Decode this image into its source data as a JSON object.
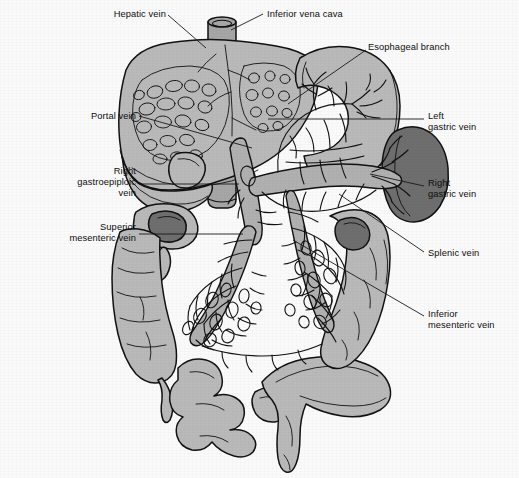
{
  "figure": {
    "background_color": "#fafafa",
    "ink_color": "#111111",
    "width": 519,
    "height": 478
  },
  "palette": {
    "organ_light_gray": "#b9b9b9",
    "organ_mid_gray": "#a6a6a6",
    "spleen_dark_gray": "#6e6e6e",
    "vessel_gray": "#b0b0b0",
    "lumen_dark": "#7a7a7a",
    "outline": "#111111",
    "paper": "#fafafa",
    "leader_line": "#1a1a1a"
  },
  "labels": [
    {
      "id": "hepatic-vein",
      "text": "Hepatic vein",
      "lines": [
        "Hepatic vein"
      ],
      "align": "right",
      "x": 84,
      "y": 9,
      "w": 82
    },
    {
      "id": "inferior-vena-cava",
      "text": "Inferior vena cava",
      "lines": [
        "Inferior vena cava"
      ],
      "align": "left",
      "x": 267,
      "y": 9,
      "w": 120
    },
    {
      "id": "esophageal-branch",
      "text": "Esophageal branch",
      "lines": [
        "Esophageal branch"
      ],
      "align": "left",
      "x": 368,
      "y": 42,
      "w": 120
    },
    {
      "id": "portal-vein",
      "text": "Portal vein",
      "lines": [
        "Portal vein"
      ],
      "align": "right",
      "x": 58,
      "y": 111,
      "w": 78
    },
    {
      "id": "left-gastric-vein",
      "text": "Left gastric vein",
      "lines": [
        "Left",
        "gastric vein"
      ],
      "align": "left",
      "x": 428,
      "y": 111,
      "w": 86
    },
    {
      "id": "right-gastroepiploic-vein",
      "text": "Right gastroepiploic vein",
      "lines": [
        "Right",
        "gastroepiploic",
        "vein"
      ],
      "align": "right",
      "x": 40,
      "y": 166,
      "w": 96
    },
    {
      "id": "right-gastric-vein",
      "text": "Right gastric vein",
      "lines": [
        "Right",
        "gastric vein"
      ],
      "align": "left",
      "x": 428,
      "y": 178,
      "w": 86
    },
    {
      "id": "superior-mesenteric-vein",
      "text": "Superior mesenteric vein",
      "lines": [
        "Superior",
        "mesenteric vein"
      ],
      "align": "right",
      "x": 26,
      "y": 222,
      "w": 110
    },
    {
      "id": "splenic-vein",
      "text": "Splenic vein",
      "lines": [
        "Splenic vein"
      ],
      "align": "left",
      "x": 428,
      "y": 248,
      "w": 86
    },
    {
      "id": "inferior-mesenteric-vein",
      "text": "Inferior mesenteric vein",
      "lines": [
        "Inferior",
        "mesenteric vein"
      ],
      "align": "left",
      "x": 428,
      "y": 309,
      "w": 90
    }
  ],
  "leaders": [
    {
      "id": "leader-hepatic-vein",
      "for": "hepatic-vein",
      "d": "M168,15 L206,48"
    },
    {
      "id": "leader-inferior-vena-cava",
      "for": "inferior-vena-cava",
      "d": "M263,14 L231,30"
    },
    {
      "id": "leader-esophageal-branch",
      "for": "esophageal-branch",
      "d": "M366,50 L288,104"
    },
    {
      "id": "leader-portal-vein",
      "for": "portal-vein",
      "d": "M139,116 L252,148"
    },
    {
      "id": "leader-left-gastric-vein",
      "for": "left-gastric-vein",
      "d": "M424,119 L268,119"
    },
    {
      "id": "leader-right-gastroepiploic-vein",
      "for": "right-gastroepiploic-vein",
      "d": "M139,184 L239,184"
    },
    {
      "id": "leader-right-gastric-vein",
      "for": "right-gastric-vein",
      "d": "M424,186 L370,174"
    },
    {
      "id": "leader-superior-mesenteric-vein",
      "for": "superior-mesenteric-vein",
      "d": "M139,234 L243,234"
    },
    {
      "id": "leader-splenic-vein",
      "for": "splenic-vein",
      "d": "M424,252 L339,194"
    },
    {
      "id": "leader-inferior-mesenteric-vein",
      "for": "inferior-mesenteric-vein",
      "d": "M424,316 L293,240"
    }
  ],
  "organs": [
    {
      "id": "liver",
      "name": "Liver",
      "fill": "#b9b9b9"
    },
    {
      "id": "gallbladder",
      "name": "Gallbladder",
      "fill": "#b9b9b9"
    },
    {
      "id": "stomach",
      "name": "Stomach",
      "fill": "#b9b9b9"
    },
    {
      "id": "spleen",
      "name": "Spleen",
      "fill": "#6e6e6e"
    },
    {
      "id": "duodenum",
      "name": "Duodenum",
      "fill": "#b9b9b9"
    },
    {
      "id": "ascending-colon",
      "name": "Ascending colon",
      "fill": "#b9b9b9"
    },
    {
      "id": "descending-colon",
      "name": "Descending colon",
      "fill": "#b9b9b9"
    },
    {
      "id": "small-intestine",
      "name": "Small intestine",
      "fill": "#b9b9b9"
    },
    {
      "id": "sigmoid-colon",
      "name": "Sigmoid colon and rectum",
      "fill": "#b9b9b9"
    },
    {
      "id": "inferior-vena-cava-trunk",
      "name": "Inferior vena cava",
      "fill": "#a6a6a6"
    }
  ]
}
